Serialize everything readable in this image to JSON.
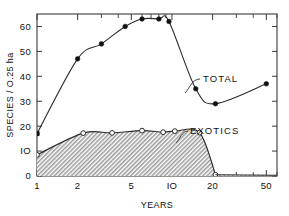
{
  "chart_data": {
    "type": "line",
    "title": "",
    "xlabel": "YEARS",
    "ylabel": "SPECIES / O.25 ha",
    "xscale": "log",
    "xlim": [
      1,
      60
    ],
    "ylim": [
      0,
      65
    ],
    "xticks": [
      1,
      2,
      5,
      10,
      20,
      50
    ],
    "xticklabels": [
      "1",
      "2",
      "5",
      "IO",
      "20",
      "50"
    ],
    "xminorticks": [
      3,
      4,
      6,
      7,
      8,
      9,
      30,
      40,
      60
    ],
    "yticks": [
      0,
      10,
      20,
      30,
      40,
      50,
      60
    ],
    "yticklabels": [
      "0",
      "IO",
      "20",
      "30",
      "40",
      "50",
      "60"
    ],
    "grid": false,
    "legend_position": "inline-annotations",
    "series": [
      {
        "name": "TOTAL",
        "marker": "filled-circle",
        "label_text": "TOTAL",
        "label_x": 22,
        "label_y": 38,
        "points": [
          {
            "x": 1,
            "y": 17
          },
          {
            "x": 2,
            "y": 47
          },
          {
            "x": 3,
            "y": 53
          },
          {
            "x": 4.5,
            "y": 60
          },
          {
            "x": 6,
            "y": 63
          },
          {
            "x": 8,
            "y": 63
          },
          {
            "x": 9.5,
            "y": 62
          },
          {
            "x": 15,
            "y": 35
          },
          {
            "x": 21,
            "y": 29
          },
          {
            "x": 50,
            "y": 37
          }
        ]
      },
      {
        "name": "EXOTICS",
        "marker": "open-circle",
        "label_text": "EXOTICS",
        "label_x": 14,
        "label_y": 24,
        "points": [
          {
            "x": 1,
            "y": 8.5
          },
          {
            "x": 2.2,
            "y": 17.2
          },
          {
            "x": 3.6,
            "y": 17.3
          },
          {
            "x": 6,
            "y": 18.2
          },
          {
            "x": 8.6,
            "y": 17.6
          },
          {
            "x": 10.5,
            "y": 18.0
          },
          {
            "x": 16,
            "y": 17.4
          },
          {
            "x": 21,
            "y": 0.5
          }
        ],
        "fill": "hatched"
      }
    ]
  },
  "figure": {
    "marker_filled_color": "#111111",
    "marker_open_color": "#ffffff",
    "line_color": "#2b2b2b",
    "frame_color": "#3a3a3a",
    "fill_pattern_color": "#8a8a8a",
    "background": "#ffffff"
  }
}
